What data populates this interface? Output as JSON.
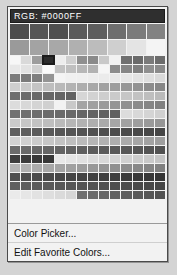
{
  "popup": {
    "header": {
      "label": "RGB: #0000FF",
      "text_color": "#ffffff",
      "background_color": "#2f2f2f"
    },
    "selected_color": "#0000FF",
    "palette": {
      "wide_rows": [
        [
          "#4c4c4c",
          "#555555",
          "#4f4f4f",
          "#5a5a5a",
          "#5e5e5e",
          "#6e6e6e",
          "#7b7b7b",
          "#828282"
        ],
        [
          "#9a9a9a",
          "#a3a3a3",
          "#a8a8a8",
          "#b0b0b0",
          "#bcbcbc",
          "#cfcfcf",
          "#e4e4e4",
          "#f4f4f4"
        ]
      ],
      "grid_columns": 14,
      "grid_rows": [
        [
          "#f7f7f7",
          "#d9d9d9",
          "#9d9d9d",
          "#3b3b3b",
          "#ededed",
          "#cfcfcf",
          "#8f8f8f",
          "#8a8a8a",
          "#c9c9c9",
          "#f2f2f2",
          "#6f6f6f",
          "#6a6a6a",
          "#7a7a7a",
          "#6c6c6c"
        ],
        [
          "#e8e8e8",
          "#e2e2e2",
          "#d0d0d0",
          "#fafafa",
          "#c2c2c2",
          "#bfbfbf",
          "#b7b7b7",
          "#b2b2b2",
          "#f6f6f6",
          "#8c8c8c",
          "#858585",
          "#7f7f7f",
          "#8f8f8f",
          "#8a8a8a"
        ],
        [
          "#7c7c7c",
          "#7a7a7a",
          "#7e7e7e",
          "#949494",
          "#f4f4f4",
          "#f0f0f0",
          "#efefef",
          "#ededed",
          "#ebebeb",
          "#e8e8e8",
          "#e6e6e6",
          "#e2e2e2",
          "#dedede",
          "#d9d9d9"
        ],
        [
          "#cfcfcf",
          "#c9c9c9",
          "#c4c4c4",
          "#bebebe",
          "#b9b9b9",
          "#b3b3b3",
          "#adadad",
          "#a8a8a8",
          "#a2a2a2",
          "#9d9d9d",
          "#979797",
          "#929292",
          "#8c8c8c",
          "#878787"
        ],
        [
          "#6f6f6f",
          "#6c6c6c",
          "#6a6a6a",
          "#676767",
          "#656565",
          "#626262",
          "#d6d6d6",
          "#d2d2d2",
          "#cecece",
          "#cacaca",
          "#c6c6c6",
          "#c2c2c2",
          "#bebebe",
          "#bababa"
        ],
        [
          "#dcdcdc",
          "#d8d8d8",
          "#d4d4d4",
          "#d0d0d0",
          "#ccccccc",
          "#c8c8c8",
          "#a4a4a4",
          "#9f9f9f",
          "#9a9a9a",
          "#959595",
          "#909090",
          "#8b8b8b",
          "#868686",
          "#818181"
        ],
        [
          "#727272",
          "#707070",
          "#6e6e6e",
          "#6c6c6c",
          "#6a6a6a",
          "#686868",
          "#666666",
          "#646464",
          "#626262",
          "#606060",
          "#dcdcdc",
          "#d8d8d8",
          "#d4d4d4",
          "#d0d0d0"
        ],
        [
          "#cacaca",
          "#c6c6c6",
          "#c2c2c2",
          "#bebebe",
          "#bababa",
          "#b6b6b6",
          "#b2b2b2",
          "#aeaeae",
          "#aaaaaa",
          "#a6a6a6",
          "#a2a2a2",
          "#9e9e9e",
          "#9a9a9a",
          "#969696"
        ],
        [
          "#5f5f5f",
          "#5d5d5d",
          "#5b5b5b",
          "#595959",
          "#575757",
          "#555555",
          "#535353",
          "#515151",
          "#4f4f4f",
          "#4d4d4d",
          "#4b4b4b",
          "#494949",
          "#474747",
          "#454545"
        ],
        [
          "#d2d2d2",
          "#cecece",
          "#cacaca",
          "#c6c6c6",
          "#c2c2c2",
          "#bebebe",
          "#bababa",
          "#b6b6b6",
          "#b2b2b2",
          "#aeaeae",
          "#aaaaaa",
          "#a6a6a6",
          "#a2a2a2",
          "#9e9e9e"
        ],
        [
          "#6b6b6b",
          "#696969",
          "#676767",
          "#656565",
          "#636363",
          "#616161",
          "#5f5f5f",
          "#5d5d5d",
          "#5b5b5b",
          "#595959",
          "#575757",
          "#555555",
          "#535353",
          "#515151"
        ],
        [
          "#3d3d3d",
          "#3b3b3b",
          "#393939",
          "#373737",
          "#e8e8e8",
          "#e4e4e4",
          "#e0e0e0",
          "#dcdcdc",
          "#d8d8d8",
          "#d4d4d4",
          "#d0d0d0",
          "#cccccc",
          "#c8c8c8",
          "#c4c4c4"
        ],
        [
          "#b4b4b4",
          "#b0b0b0",
          "#acacac",
          "#a8a8a8",
          "#a4a4a4",
          "#a0a0a0",
          "#9c9c9c",
          "#989898",
          "#949494",
          "#909090",
          "#8c8c8c",
          "#888888",
          "#848484",
          "#808080"
        ],
        [
          "#4f4f4f",
          "#4d4d4d",
          "#4b4b4b",
          "#494949",
          "#474747",
          "#454545",
          "#434343",
          "#414141",
          "#3f3f3f",
          "#3d3d3d",
          "#3b3b3b",
          "#393939",
          "#373737",
          "#353535"
        ],
        [
          "#606060",
          "#5e5e5e",
          "#5c5c5c",
          "#5a5a5a",
          "#585858",
          "#565656",
          "#545454",
          "#525252",
          "#505050",
          "#4e4e4e",
          "#4c4c4c",
          "#4a4a4a",
          "#484848",
          "#464646"
        ],
        [
          "#eaeaea",
          "#e6e6e6",
          "#e2e2e2",
          "#dedede",
          "#dadada",
          "#d6d6d6",
          "#6e6e6e",
          "#6a6a6a",
          "#666666",
          "#626262",
          "#5e5e5e",
          "#5a5a5a",
          "#565656",
          "#525252"
        ]
      ],
      "selected_index": {
        "row": 0,
        "col": 3
      }
    },
    "menu": {
      "items": [
        {
          "label": "Color Picker..."
        },
        {
          "label": "Edit Favorite Colors..."
        }
      ]
    }
  }
}
